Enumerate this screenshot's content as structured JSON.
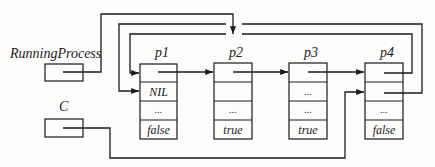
{
  "variables": {
    "running_process": {
      "label": "RunningProcess"
    },
    "c": {
      "label": "C"
    }
  },
  "records": [
    {
      "id": "p1",
      "label": "p1",
      "fields": [
        "",
        "NIL",
        "...",
        "false"
      ]
    },
    {
      "id": "p2",
      "label": "p2",
      "fields": [
        "",
        "",
        "...",
        "true"
      ]
    },
    {
      "id": "p3",
      "label": "p3",
      "fields": [
        "",
        "...",
        "...",
        "true"
      ]
    },
    {
      "id": "p4",
      "label": "p4",
      "fields": [
        "",
        "",
        "...",
        "false"
      ]
    }
  ],
  "edges": [
    {
      "from": "RunningProcess",
      "to": "p2"
    },
    {
      "from": "p1.field0",
      "to": "p2"
    },
    {
      "from": "p2.field0",
      "to": "p3"
    },
    {
      "from": "p3.field0",
      "to": "p4"
    },
    {
      "from": "p4.field0",
      "to": "p1.field0"
    },
    {
      "from": "p4.field2",
      "to": "p1.field1"
    },
    {
      "from": "C",
      "to": "p4.field1"
    }
  ]
}
